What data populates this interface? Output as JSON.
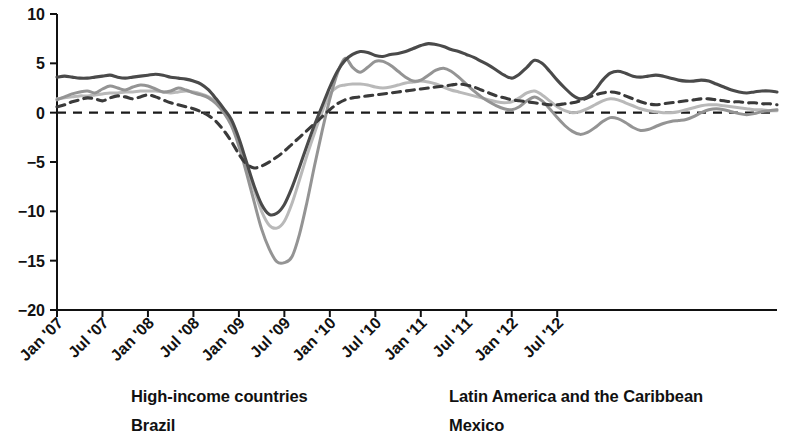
{
  "chart_data": {
    "type": "line",
    "title": "",
    "subtitle": "",
    "xlabel": "",
    "ylabel": "",
    "ylim": [
      -20,
      10
    ],
    "yticks": [
      10,
      5,
      0,
      -5,
      -10,
      -15,
      -20
    ],
    "ytick_labels": [
      "10",
      "5",
      "0",
      "−5",
      "−10",
      "−15",
      "−20"
    ],
    "grid": false,
    "zero_reference_line": true,
    "legend_position": "bottom",
    "xtick_labels": [
      "Jan '07",
      "Jul '07",
      "Jan '08",
      "Jul '08",
      "Jan '09",
      "Jul '09",
      "Jan '10",
      "Jul '10",
      "Jan '11",
      "Jul '11",
      "Jan '12",
      "Jul '12"
    ],
    "x_start_month": "Jan '07",
    "x_end_month": "Dec '12",
    "x_tick_interval_months": 6,
    "series": [
      {
        "name": "High-income countries",
        "color": "#4a4a4a",
        "style": "solid",
        "width": 3.1,
        "values": [
          3.6,
          3.7,
          3.6,
          3.5,
          3.5,
          3.6,
          3.7,
          3.8,
          3.6,
          3.5,
          3.6,
          3.7,
          3.8,
          3.9,
          3.8,
          3.6,
          3.5,
          3.4,
          3.2,
          2.9,
          2.3,
          1.4,
          0.4,
          -0.7,
          -2.6,
          -5.0,
          -7.4,
          -9.3,
          -10.3,
          -10.2,
          -9.3,
          -7.6,
          -5.5,
          -3.3,
          -1.2,
          0.7,
          2.6,
          4.2,
          5.3,
          5.9,
          6.2,
          6.1,
          5.8,
          5.7,
          5.9,
          6.0,
          6.2,
          6.5,
          6.8,
          7.0,
          6.9,
          6.7,
          6.4,
          6.2,
          5.9,
          5.6,
          5.2,
          4.8,
          4.3,
          3.8,
          3.5,
          3.9,
          4.6,
          5.3,
          5.0,
          4.2,
          3.3,
          2.5,
          1.8,
          1.4,
          1.6,
          2.3,
          3.3,
          4.0,
          4.2,
          4.0,
          3.7,
          3.6,
          3.7,
          3.8,
          3.7,
          3.5,
          3.3,
          3.2,
          3.2,
          3.3,
          3.2,
          2.9,
          2.6,
          2.3,
          2.1,
          2.0,
          2.1,
          2.2,
          2.2,
          2.1
        ]
      },
      {
        "name": "Latin America and the Caribbean",
        "color": "#b9b9b9",
        "style": "solid",
        "width": 3.0,
        "values": [
          1.4,
          1.5,
          1.6,
          1.7,
          1.7,
          1.8,
          1.9,
          2.0,
          2.0,
          2.1,
          2.1,
          2.2,
          2.2,
          2.2,
          2.1,
          2.0,
          2.1,
          2.2,
          2.1,
          1.9,
          1.6,
          1.1,
          0.3,
          -0.9,
          -2.8,
          -5.3,
          -7.8,
          -10.0,
          -11.4,
          -11.7,
          -11.0,
          -9.2,
          -6.8,
          -4.3,
          -2.0,
          0.1,
          1.9,
          2.6,
          2.8,
          2.9,
          2.9,
          2.8,
          2.6,
          2.5,
          2.6,
          2.8,
          3.0,
          3.1,
          3.2,
          3.1,
          2.9,
          2.6,
          2.3,
          2.1,
          1.9,
          1.7,
          1.5,
          1.3,
          1.1,
          1.0,
          1.1,
          1.5,
          2.0,
          2.2,
          1.8,
          1.2,
          0.6,
          0.2,
          0.0,
          0.1,
          0.4,
          0.8,
          1.2,
          1.4,
          1.3,
          1.0,
          0.7,
          0.4,
          0.2,
          0.1,
          0.0,
          0.0,
          0.1,
          0.3,
          0.5,
          0.7,
          0.8,
          0.8,
          0.7,
          0.6,
          0.5,
          0.4,
          0.3,
          0.3,
          0.2,
          0.2
        ]
      },
      {
        "name": "Brazil",
        "color": "#949494",
        "style": "solid",
        "width": 3.0,
        "values": [
          1.3,
          1.6,
          1.9,
          2.1,
          2.2,
          2.0,
          2.4,
          2.7,
          2.5,
          2.3,
          2.6,
          2.8,
          2.7,
          2.4,
          2.1,
          2.2,
          2.5,
          2.3,
          2.0,
          1.8,
          1.5,
          0.9,
          0.0,
          -1.3,
          -3.4,
          -6.1,
          -9.0,
          -11.8,
          -13.8,
          -15.1,
          -15.2,
          -14.6,
          -12.3,
          -9.0,
          -5.3,
          -1.8,
          1.4,
          4.0,
          5.5,
          4.6,
          4.1,
          4.6,
          5.2,
          5.2,
          4.8,
          4.2,
          3.6,
          3.2,
          3.3,
          3.8,
          4.3,
          4.5,
          4.2,
          3.6,
          2.9,
          2.2,
          1.6,
          1.1,
          0.7,
          0.4,
          0.3,
          0.6,
          1.2,
          1.6,
          1.2,
          0.4,
          -0.5,
          -1.3,
          -1.9,
          -2.2,
          -2.0,
          -1.5,
          -0.9,
          -0.5,
          -0.6,
          -1.0,
          -1.5,
          -1.8,
          -1.7,
          -1.4,
          -1.1,
          -0.9,
          -0.8,
          -0.7,
          -0.4,
          0.0,
          0.3,
          0.4,
          0.3,
          0.1,
          -0.1,
          -0.2,
          -0.1,
          0.1,
          0.2,
          0.3
        ]
      },
      {
        "name": "Mexico",
        "color": "#3a3a3a",
        "style": "dashed",
        "width": 3.1,
        "values": [
          0.6,
          0.8,
          1.1,
          1.3,
          1.5,
          1.4,
          1.2,
          1.5,
          1.7,
          1.6,
          1.4,
          1.6,
          1.8,
          1.6,
          1.3,
          1.0,
          0.8,
          0.6,
          0.4,
          0.1,
          -0.3,
          -0.9,
          -1.8,
          -2.9,
          -4.2,
          -5.2,
          -5.6,
          -5.4,
          -5.0,
          -4.5,
          -3.9,
          -3.2,
          -2.5,
          -1.8,
          -1.1,
          -0.4,
          0.3,
          0.9,
          1.3,
          1.5,
          1.6,
          1.7,
          1.8,
          1.9,
          2.0,
          2.1,
          2.2,
          2.3,
          2.4,
          2.5,
          2.6,
          2.7,
          2.8,
          2.9,
          2.8,
          2.6,
          2.3,
          2.0,
          1.7,
          1.5,
          1.3,
          1.2,
          1.1,
          1.0,
          0.9,
          0.8,
          0.8,
          0.9,
          1.0,
          1.2,
          1.5,
          1.8,
          2.0,
          2.1,
          2.0,
          1.7,
          1.4,
          1.1,
          0.9,
          0.8,
          0.9,
          1.0,
          1.1,
          1.2,
          1.3,
          1.4,
          1.4,
          1.3,
          1.2,
          1.1,
          1.1,
          1.0,
          1.0,
          0.9,
          0.9,
          0.8
        ]
      }
    ]
  },
  "legend": {
    "items": [
      {
        "label": "High-income countries",
        "series": 0
      },
      {
        "label": "Latin America and the Caribbean",
        "series": 1
      },
      {
        "label": "Brazil",
        "series": 2
      },
      {
        "label": "Mexico",
        "series": 3
      }
    ]
  }
}
